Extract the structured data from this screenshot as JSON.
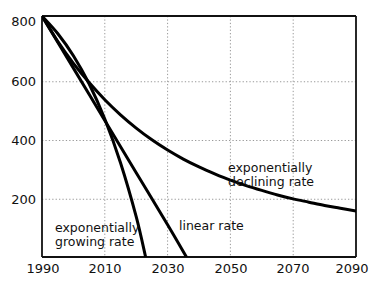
{
  "chart_data": {
    "type": "line",
    "title": "",
    "subtitle": "",
    "xlabel": "",
    "ylabel": "",
    "xlim": [
      1990,
      2090
    ],
    "ylim": [
      0,
      800
    ],
    "grid": true,
    "grid_style": "dotted",
    "grid_color": "#9a9a9a",
    "legend_position": "inline-annotations",
    "axis_color": "#111111",
    "line_color": "#000000",
    "background_color": "#ffffff",
    "x_ticks": [
      {
        "value": 1990,
        "label": "1990"
      },
      {
        "value": 2010,
        "label": "2010"
      },
      {
        "value": 2030,
        "label": "2030"
      },
      {
        "value": 2050,
        "label": "2050"
      },
      {
        "value": 2070,
        "label": "2070"
      },
      {
        "value": 2090,
        "label": "2090"
      }
    ],
    "y_ticks": [
      {
        "value": 200,
        "label": "200"
      },
      {
        "value": 400,
        "label": "400"
      },
      {
        "value": 600,
        "label": "600"
      },
      {
        "value": 800,
        "label": "800"
      }
    ],
    "series": [
      {
        "name": "exponentially declining rate",
        "x": [
          1990,
          1995,
          2000,
          2005,
          2010,
          2015,
          2020,
          2025,
          2030,
          2035,
          2040,
          2045,
          2050,
          2055,
          2060,
          2065,
          2070,
          2075,
          2080,
          2085,
          2090
        ],
        "values": [
          800,
          716,
          643,
          579,
          522,
          472,
          428,
          389,
          355,
          325,
          299,
          276,
          255,
          237,
          221,
          206,
          193,
          182,
          171,
          162,
          153
        ]
      },
      {
        "name": "linear rate",
        "x": [
          1990,
          2000,
          2010,
          2020,
          2030,
          2036
        ],
        "values": [
          800,
          627,
          453,
          280,
          107,
          0
        ]
      },
      {
        "name": "exponentially growing rate",
        "x": [
          1990,
          1995,
          2000,
          2005,
          2010,
          2015,
          2020,
          2023
        ],
        "values": [
          800,
          742,
          668,
          575,
          458,
          313,
          134,
          0
        ]
      }
    ],
    "annotations": [
      {
        "id": "declining",
        "line1": "exponentially",
        "line2": "declining rate"
      },
      {
        "id": "linear",
        "line1": "linear rate",
        "line2": ""
      },
      {
        "id": "growing",
        "line1": "exponentially",
        "line2": "growing rate"
      }
    ]
  }
}
